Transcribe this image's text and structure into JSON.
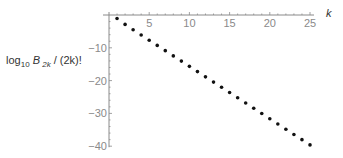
{
  "chart_data": {
    "type": "scatter",
    "title": "",
    "xlabel": "k",
    "ylabel": "log10 B 2k / (2k)!",
    "ylabel_parts": {
      "base": "log",
      "sub1": "10",
      "B": "B",
      "sub2": "2k",
      "rest": " / (2k)!"
    },
    "xlim": [
      0,
      25.5
    ],
    "ylim": [
      -40,
      0
    ],
    "x_ticks": [
      5,
      10,
      15,
      20,
      25
    ],
    "y_ticks": [
      -10,
      -20,
      -30,
      -40
    ],
    "grid": false,
    "legend": null,
    "series": [
      {
        "name": "log10 |B_2k|/(2k)!",
        "x": [
          1,
          2,
          3,
          4,
          5,
          6,
          7,
          8,
          9,
          10,
          11,
          12,
          13,
          14,
          15,
          16,
          17,
          18,
          19,
          20,
          21,
          22,
          23,
          24,
          25
        ],
        "y": [
          -1.08,
          -2.86,
          -4.48,
          -6.08,
          -7.68,
          -9.27,
          -10.87,
          -12.47,
          -14.06,
          -15.66,
          -17.26,
          -18.85,
          -20.45,
          -22.05,
          -23.64,
          -25.24,
          -26.84,
          -28.43,
          -30.03,
          -31.63,
          -33.22,
          -34.82,
          -36.42,
          -38.01,
          -39.61
        ]
      }
    ]
  }
}
